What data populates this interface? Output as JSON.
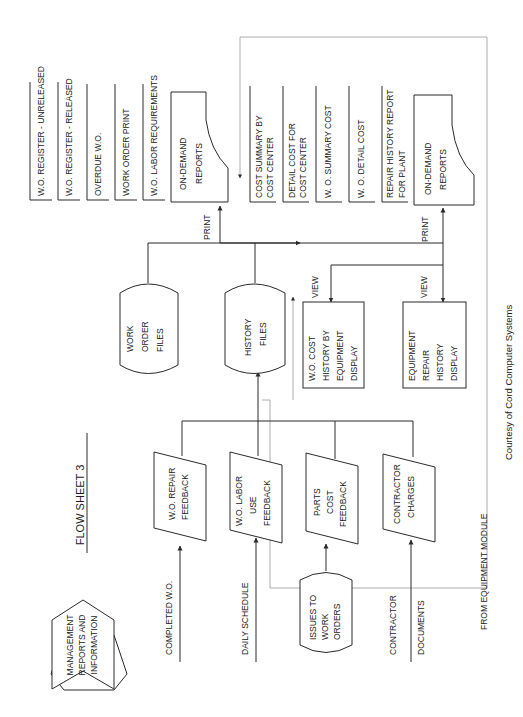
{
  "title": "FLOW SHEET 3",
  "legend": {
    "shape": "hexagon",
    "label": [
      "MANAGEMENT",
      "REPORTS AND",
      "INFORMATION"
    ]
  },
  "credit": "Courtesy of Cord Computer Systems",
  "inputs": [
    {
      "label": [
        "COMPLETED W.O."
      ]
    },
    {
      "label": [
        "DAILY SCHEDULE"
      ]
    },
    {
      "label": [
        "ISSUES TO",
        "WORK",
        "ORDERS"
      ],
      "shape": "cylinder"
    },
    {
      "label": [
        "CONTRACTOR",
        "DOCUMENTS"
      ]
    }
  ],
  "feedback": [
    {
      "label": [
        "W.O. REPAIR",
        "FEEDBACK"
      ]
    },
    {
      "label": [
        "W.O. LABOR",
        "USE",
        "FEEDBACK"
      ]
    },
    {
      "label": [
        "PARTS",
        "COST",
        "FEEDBACK"
      ]
    },
    {
      "label": [
        "CONTRACTOR",
        "CHARGES"
      ]
    }
  ],
  "files": [
    {
      "label": [
        "WORK",
        "ORDER",
        "FILES"
      ]
    },
    {
      "label": [
        "HISTORY",
        "FILES"
      ]
    }
  ],
  "reports_left": {
    "on_demand": [
      "ON-DEMAND",
      "REPORTS"
    ],
    "print_label": "PRINT",
    "items": [
      [
        "W.O. REGISTER - UNRELEASED"
      ],
      [
        "W.O. REGISTER - RELEASED"
      ],
      [
        "OVERDUE W.O."
      ],
      [
        "WORK ORDER PRINT"
      ],
      [
        "W.O. LABOR REQUIREMENTS"
      ]
    ]
  },
  "equipment_module": {
    "label": "FROM EQUIPMENT MODULE",
    "on_demand": [
      "ON-DEMAND",
      "REPORTS"
    ],
    "print_label": "PRINT",
    "view_label": "VIEW",
    "items": [
      [
        "COST SUMMARY BY",
        "COST CENTER"
      ],
      [
        "DETAIL COST FOR",
        "COST CENTER"
      ],
      [
        "W. O. SUMMARY COST"
      ],
      [
        "W. O. DETAIL COST"
      ],
      [
        "REPAIR HISTORY REPORT",
        "FOR PLANT"
      ]
    ],
    "displays": [
      {
        "label": [
          "W.O. COST",
          "HISTORY BY",
          "EQUIPMENT",
          "DISPLAY"
        ]
      },
      {
        "label": [
          "EQUIPMENT",
          "REPAIR",
          "HISTORY",
          "DISPLAY"
        ]
      }
    ]
  }
}
